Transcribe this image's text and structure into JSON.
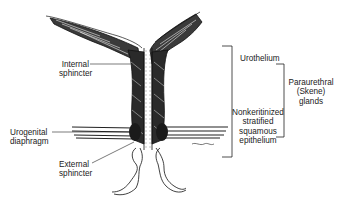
{
  "figure": {
    "type": "anatomical-illustration",
    "artist_signature": "Eiskaw"
  },
  "labels": {
    "internal_sphincter": [
      "Internal",
      "sphincter"
    ],
    "urogenital_diaphragm": [
      "Urogenital",
      "diaphragm"
    ],
    "external_sphincter": [
      "External",
      "sphincter"
    ],
    "urothelium": "Urothelium",
    "nonkeratinized": [
      "Nonkeritinized",
      "stratified",
      "squamous",
      "epithelium"
    ],
    "paraurethral": [
      "Paraurethral",
      "(Skene)",
      "glands"
    ]
  },
  "colors": {
    "ink": "#1a1a1a",
    "background": "#ffffff"
  }
}
